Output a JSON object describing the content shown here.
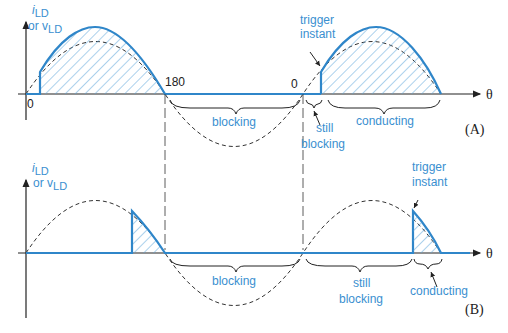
{
  "colors": {
    "waveform": "#2f86c9",
    "label": "#3a8fd0",
    "axis": "#222222",
    "dashed": "#333333"
  },
  "axis": {
    "y_label_main": "i",
    "y_label_main_sub": "LD",
    "y_label_or": "or v",
    "y_label_or_sub": "LD",
    "x_label": "θ"
  },
  "panel_a": {
    "id": "(A)",
    "tick_zero": "0",
    "tick_180": "180",
    "tick_zero_2": "0",
    "trigger_label_line1": "trigger",
    "trigger_label_line2": "instant",
    "blocking_label": "blocking",
    "still_blocking_line1": "still",
    "still_blocking_line2": "blocking",
    "conducting_label": "conducting"
  },
  "panel_b": {
    "id": "(B)",
    "trigger_label_line1": "trigger",
    "trigger_label_line2": "instant",
    "blocking_label": "blocking",
    "still_blocking_line1": "still",
    "still_blocking_line2": "blocking",
    "conducting_label": "conducting"
  }
}
